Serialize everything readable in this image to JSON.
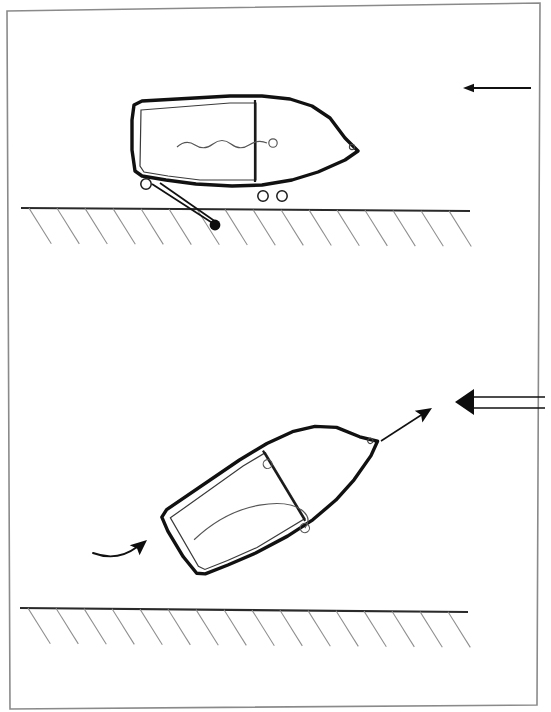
{
  "document": {
    "type": "patent-line-drawing",
    "sheet_background": "#ffffff",
    "ink_color": "#1a1a1a",
    "light_ink_color": "#6e6e6e",
    "page_border": {
      "name": "page-border",
      "points": "7,11 540,3 537,705 10,709"
    }
  },
  "figures": [
    {
      "id": "figure-top",
      "caption": "Boat in level stowed position on trailer",
      "ground": {
        "name": "ground-line-top",
        "line": {
          "x1": 21,
          "y1": 208,
          "x2": 470,
          "y2": 211
        },
        "hatch_count": 16,
        "hatch_angle_deg": 58,
        "hatch_length": 42,
        "hatch_spacing": 28
      },
      "boat": {
        "name": "boat-hull-level",
        "rotation_deg": 0,
        "hull_outline": "134,105 142,101 230,96 262,96 290,99 312,106 330,118 345,138 358,151 345,160 318,172 292,180 262,185 232,186 196,184 166,180 142,176 135,171 132,150 132,120",
        "transom_inner": "141,110 230,103 256,103 256,180 200,180 168,176 144,172 140,166",
        "deck_divider": {
          "x1": 255,
          "y1": 100,
          "x2": 255,
          "y2": 182
        },
        "bow_eye": {
          "cx": 352,
          "cy": 147,
          "r": 2.6
        },
        "rope": {
          "name": "rope-wavy",
          "path": "M177,147 q9,-8 18,-2 q9,6 18,-1 q9,-7 18,0 q9,7 18,1 q9,-6 18,-2",
          "cleat": {
            "cx": 273,
            "cy": 143,
            "r": 4.2
          }
        },
        "rollers": [
          {
            "name": "roller-aft",
            "cx": 146,
            "cy": 184,
            "r": 5.2
          },
          {
            "name": "roller-mid",
            "cx": 263,
            "cy": 196,
            "r": 5.2
          },
          {
            "name": "roller-fwd",
            "cx": 282,
            "cy": 196,
            "r": 5.2
          }
        ],
        "strut": {
          "name": "pivot-strut",
          "line_a": {
            "x1": 152,
            "y1": 184,
            "x2": 214,
            "y2": 224
          },
          "line_b": {
            "x1": 160,
            "y1": 183,
            "x2": 216,
            "y2": 222
          }
        },
        "pivot": {
          "name": "pivot-point",
          "cx": 215,
          "cy": 225,
          "r": 5.4
        }
      },
      "arrow": {
        "name": "direction-arrow-thin",
        "label": "travel direction",
        "x_tail": 531,
        "x_head": 463,
        "y": 88,
        "style": "thin-line-left"
      }
    },
    {
      "id": "figure-bottom",
      "caption": "Boat tilted on trailer for launching",
      "ground": {
        "name": "ground-line-bottom",
        "line": {
          "x1": 20,
          "y1": 608,
          "x2": 468,
          "y2": 612
        },
        "hatch_count": 16,
        "hatch_angle_deg": 58,
        "hatch_length": 42,
        "hatch_spacing": 28
      },
      "boat": {
        "name": "boat-hull-tilted",
        "rotation_deg": -31,
        "rotation_origin": "268,490",
        "hull_outline": "134,105 142,101 230,96 262,96 290,99 312,106 330,118 345,138 358,151 345,160 318,172 292,180 262,185 232,186 196,184 166,180 142,176 135,171 132,150 132,120",
        "transom_inner": "141,110 230,103 256,103 256,180 200,180 168,176 144,172 140,166",
        "deck_divider": {
          "x1": 255,
          "y1": 100,
          "x2": 255,
          "y2": 182
        },
        "bow_eye": {
          "cx": 352,
          "cy": 147,
          "r": 2.6
        },
        "rope": {
          "name": "rope-loop",
          "path": "M150,141 q40,-9 74,4 q28,11 34,27 q4,12 -7,16",
          "cleat_a": {
            "cx": 252,
            "cy": 114,
            "r": 4.4
          },
          "cleat_b": {
            "cx": 251,
            "cy": 188,
            "r": 4.6
          }
        }
      },
      "arrows": [
        {
          "name": "direction-arrow-bold",
          "label": "water flow / launch direction",
          "x_tail": 545,
          "x_head": 455,
          "y": 402,
          "style": "bold-double-line-left"
        },
        {
          "name": "bow-lift-arrow",
          "label": "bow rises",
          "x1": 381,
          "y1": 441,
          "x2": 432,
          "y2": 408,
          "style": "solid-head-up-right"
        },
        {
          "name": "stern-drop-arrow",
          "label": "stern swings down",
          "path": "M93,553 q24,9 44,-6",
          "head_x": 147,
          "head_y": 540,
          "style": "curved-head-up-right"
        }
      ]
    }
  ]
}
